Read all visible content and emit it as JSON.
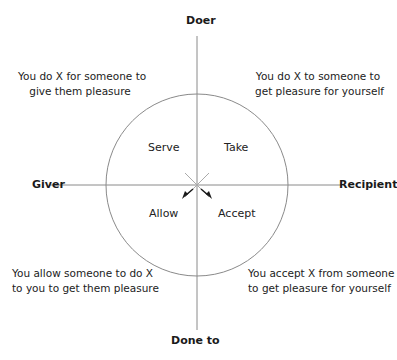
{
  "axes": {
    "top": "Doer",
    "bottom": "Done to",
    "left": "Giver",
    "right": "Recipient"
  },
  "quadrants": {
    "top_left": "Serve",
    "top_right": "Take",
    "bottom_left": "Allow",
    "bottom_right": "Accept"
  },
  "descriptions": {
    "top_left": [
      "You do X for someone to",
      "give them pleasure"
    ],
    "top_right": [
      "You do X to someone to",
      "get pleasure for yourself"
    ],
    "bottom_left": [
      "You allow someone to do X",
      "to you to get them pleasure"
    ],
    "bottom_right": [
      "You accept X from someone",
      "to get pleasure for yourself"
    ]
  },
  "colors": {
    "line": "#8a8a8a",
    "arrow": "#1a1a1a",
    "text": "#222222"
  }
}
